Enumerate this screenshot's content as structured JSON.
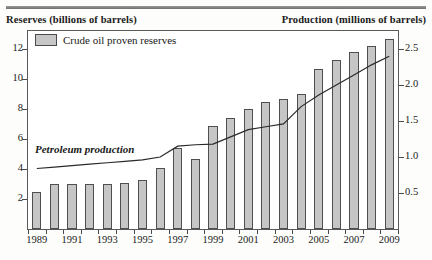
{
  "axis_titles": {
    "left": "Reserves (billions of barrels)",
    "right": "Production (millions of barrels)"
  },
  "legend": {
    "label": "Crude oil proven reserves",
    "swatch_color": "#c6c6c6"
  },
  "line_label": "Petroleum production",
  "colors": {
    "bar_fill": "#c6c6c6",
    "bar_stroke": "#4f4f4f",
    "line": "#2a2a2a",
    "frame": "#5a5a5a"
  },
  "chart_data": {
    "type": "bar",
    "title": "",
    "xlabel": "",
    "ylabel": "Reserves (billions of barrels)",
    "y2label": "Production (millions of barrels)",
    "grid": false,
    "legend_position": "top-left",
    "x": [
      1989,
      1990,
      1991,
      1992,
      1993,
      1994,
      1995,
      1996,
      1997,
      1998,
      1999,
      2000,
      2001,
      2002,
      2003,
      2004,
      2005,
      2006,
      2007,
      2008,
      2009
    ],
    "categories": [
      "1989",
      "1990",
      "1991",
      "1992",
      "1993",
      "1994",
      "1995",
      "1996",
      "1997",
      "1998",
      "1999",
      "2000",
      "2001",
      "2002",
      "2003",
      "2004",
      "2005",
      "2006",
      "2007",
      "2008",
      "2009"
    ],
    "tick_labels_shown": [
      "1989",
      "1991",
      "1993",
      "1995",
      "1997",
      "1999",
      "2001",
      "2003",
      "2005",
      "2007",
      "2009"
    ],
    "ylim": [
      0,
      13.2
    ],
    "yticks": [
      2,
      4,
      6,
      8,
      10,
      12
    ],
    "y2lim": [
      0,
      2.75
    ],
    "y2ticks": [
      0.5,
      1.0,
      1.5,
      2.0,
      2.5
    ],
    "series": [
      {
        "name": "Crude oil proven reserves",
        "type": "bar",
        "axis": "left",
        "units": "billions of barrels",
        "values": [
          2.5,
          3.0,
          3.0,
          3.0,
          3.0,
          3.1,
          3.3,
          4.1,
          5.4,
          4.7,
          6.9,
          7.4,
          8.0,
          8.5,
          8.7,
          9.0,
          10.7,
          11.3,
          11.8,
          12.2,
          12.7
        ]
      },
      {
        "name": "Petroleum production",
        "type": "line",
        "axis": "right",
        "units": "millions of barrels",
        "values": [
          0.84,
          0.86,
          0.88,
          0.9,
          0.92,
          0.94,
          0.96,
          1.0,
          1.15,
          1.17,
          1.18,
          1.28,
          1.38,
          1.42,
          1.46,
          1.7,
          1.86,
          2.0,
          2.14,
          2.28,
          2.4
        ]
      }
    ]
  }
}
